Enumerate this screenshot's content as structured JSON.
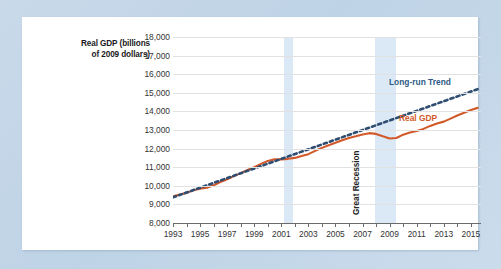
{
  "figure": {
    "background_color": "#c3d5e7",
    "panel_color": "#ffffff"
  },
  "axis_title": {
    "line1": "Real GDP (billions",
    "line2": "of 2009 dollars)"
  },
  "annotations": {
    "trend_label": "Long-run Trend",
    "gdp_label": "Real GDP",
    "recession_label": "Great Recession"
  },
  "colors": {
    "real_gdp": "#d2592a",
    "long_run_trend": "#2e4d70",
    "recession_band": "#dbe9f7",
    "gridline": "#e2e2e2"
  },
  "chart_data": {
    "type": "line",
    "title": "",
    "xlabel": "",
    "ylabel": "Real GDP (billions of 2009 dollars)",
    "xlim": [
      1993,
      2015.75
    ],
    "ylim": [
      8000,
      18000
    ],
    "ytick_labels": [
      "18,000",
      "17,000",
      "16,000",
      "15,000",
      "14,000",
      "13,000",
      "12,000",
      "11,000",
      "10,000",
      "9,000",
      "8,000"
    ],
    "yticks": [
      18000,
      17000,
      16000,
      15000,
      14000,
      13000,
      12000,
      11000,
      10000,
      9000,
      8000
    ],
    "xtick_labels": [
      "1993",
      "1995",
      "1997",
      "1999",
      "2001",
      "2003",
      "2005",
      "2007",
      "2009",
      "2011",
      "2013",
      "2015"
    ],
    "xticks_labeled": [
      1993,
      1995,
      1997,
      1999,
      2001,
      2003,
      2005,
      2007,
      2009,
      2011,
      2013,
      2015
    ],
    "xticks_minor": [
      1994,
      1996,
      1998,
      2000,
      2002,
      2004,
      2006,
      2008,
      2010,
      2012,
      2014
    ],
    "grid": true,
    "legend_position": "inline-right",
    "recession_bands": [
      {
        "start": 2001.2,
        "end": 2001.9,
        "label": ""
      },
      {
        "start": 2007.95,
        "end": 2009.45,
        "label": "Great Recession"
      }
    ],
    "series": [
      {
        "name": "Real GDP",
        "color": "#d2592a",
        "style": "solid",
        "x": [
          1993.0,
          1993.5,
          1994.0,
          1994.5,
          1995.0,
          1995.5,
          1996.0,
          1996.5,
          1997.0,
          1997.5,
          1998.0,
          1998.5,
          1999.0,
          1999.5,
          2000.0,
          2000.5,
          2001.0,
          2001.5,
          2002.0,
          2002.5,
          2003.0,
          2003.5,
          2004.0,
          2004.5,
          2005.0,
          2005.5,
          2006.0,
          2006.5,
          2007.0,
          2007.5,
          2008.0,
          2008.5,
          2009.0,
          2009.5,
          2010.0,
          2010.5,
          2011.0,
          2011.5,
          2012.0,
          2012.5,
          2013.0,
          2013.5,
          2014.0,
          2014.5,
          2015.0,
          2015.5
        ],
        "y": [
          9430,
          9530,
          9620,
          9760,
          9840,
          9900,
          10030,
          10200,
          10350,
          10520,
          10680,
          10850,
          11000,
          11180,
          11330,
          11420,
          11420,
          11450,
          11500,
          11600,
          11700,
          11880,
          12040,
          12180,
          12310,
          12450,
          12570,
          12660,
          12760,
          12830,
          12790,
          12660,
          12540,
          12570,
          12750,
          12870,
          12950,
          13060,
          13220,
          13350,
          13450,
          13610,
          13780,
          13930,
          14080,
          14190
        ]
      },
      {
        "name": "Long-run Trend",
        "color": "#2e4d70",
        "style": "dotted",
        "x": [
          1993.0,
          2015.6
        ],
        "y": [
          9380,
          15220
        ]
      }
    ]
  }
}
